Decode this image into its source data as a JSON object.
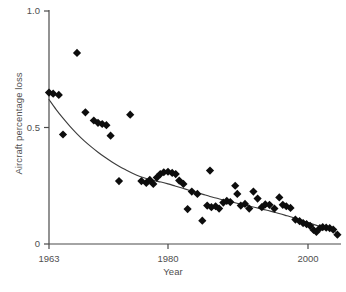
{
  "chart_data": {
    "type": "scatter",
    "title": "",
    "xlabel": "Year",
    "ylabel": "Aircraft percentage loss",
    "xlim": [
      1962,
      2005
    ],
    "ylim": [
      0,
      1.0
    ],
    "xticks": [
      1963,
      1980,
      2000
    ],
    "xticklabels": [
      "1963",
      "1980",
      "2000"
    ],
    "yticks": [
      0,
      0.5,
      1.0
    ],
    "yticklabels": [
      "0",
      "0.5",
      "1.0"
    ],
    "grid": false,
    "legend": null,
    "marker_style": "filled-diamond",
    "marker_color": "#0d0d0d",
    "series": [
      {
        "name": "Aircraft percentage loss",
        "points": [
          [
            1963.0,
            0.65
          ],
          [
            1963.6,
            0.645
          ],
          [
            1964.4,
            0.64
          ],
          [
            1965.0,
            0.47
          ],
          [
            1967.0,
            0.82
          ],
          [
            1968.2,
            0.565
          ],
          [
            1969.4,
            0.53
          ],
          [
            1970.0,
            0.52
          ],
          [
            1970.6,
            0.515
          ],
          [
            1971.2,
            0.51
          ],
          [
            1971.8,
            0.465
          ],
          [
            1973.0,
            0.27
          ],
          [
            1974.6,
            0.555
          ],
          [
            1976.2,
            0.27
          ],
          [
            1976.9,
            0.262
          ],
          [
            1977.4,
            0.275
          ],
          [
            1977.9,
            0.258
          ],
          [
            1978.4,
            0.285
          ],
          [
            1978.9,
            0.3
          ],
          [
            1979.4,
            0.308
          ],
          [
            1980.0,
            0.31
          ],
          [
            1980.6,
            0.305
          ],
          [
            1981.1,
            0.3
          ],
          [
            1981.6,
            0.272
          ],
          [
            1982.2,
            0.258
          ],
          [
            1982.8,
            0.15
          ],
          [
            1983.4,
            0.225
          ],
          [
            1984.2,
            0.215
          ],
          [
            1984.9,
            0.1
          ],
          [
            1985.6,
            0.165
          ],
          [
            1986.2,
            0.158
          ],
          [
            1986.8,
            0.162
          ],
          [
            1987.3,
            0.152
          ],
          [
            1987.9,
            0.178
          ],
          [
            1988.4,
            0.185
          ],
          [
            1986.0,
            0.315
          ],
          [
            1988.9,
            0.18
          ],
          [
            1989.6,
            0.25
          ],
          [
            1989.9,
            0.215
          ],
          [
            1990.4,
            0.165
          ],
          [
            1991.0,
            0.172
          ],
          [
            1991.6,
            0.152
          ],
          [
            1992.2,
            0.225
          ],
          [
            1992.8,
            0.195
          ],
          [
            1993.4,
            0.158
          ],
          [
            1993.9,
            0.17
          ],
          [
            1994.5,
            0.168
          ],
          [
            1995.2,
            0.152
          ],
          [
            1995.9,
            0.2
          ],
          [
            1996.4,
            0.168
          ],
          [
            1996.9,
            0.162
          ],
          [
            1997.5,
            0.155
          ],
          [
            1998.2,
            0.105
          ],
          [
            1998.8,
            0.098
          ],
          [
            1999.3,
            0.09
          ],
          [
            1999.8,
            0.085
          ],
          [
            2000.3,
            0.078
          ],
          [
            2000.8,
            0.06
          ],
          [
            2001.2,
            0.052
          ],
          [
            2001.7,
            0.068
          ],
          [
            2002.1,
            0.072
          ],
          [
            2002.6,
            0.07
          ],
          [
            2003.1,
            0.068
          ],
          [
            2003.6,
            0.062
          ],
          [
            2004.2,
            0.04
          ]
        ]
      }
    ],
    "trend_curve": {
      "name": "fitted exponential decay",
      "points": [
        [
          1963.0,
          0.62
        ],
        [
          1964.0,
          0.578
        ],
        [
          1965.0,
          0.54
        ],
        [
          1966.0,
          0.505
        ],
        [
          1967.0,
          0.473
        ],
        [
          1968.0,
          0.444
        ],
        [
          1969.0,
          0.418
        ],
        [
          1970.0,
          0.394
        ],
        [
          1971.0,
          0.372
        ],
        [
          1972.0,
          0.352
        ],
        [
          1973.0,
          0.334
        ],
        [
          1974.0,
          0.318
        ],
        [
          1975.0,
          0.303
        ],
        [
          1976.0,
          0.29
        ],
        [
          1977.0,
          0.28
        ],
        [
          1978.0,
          0.272
        ],
        [
          1979.0,
          0.266
        ],
        [
          1980.0,
          0.258
        ],
        [
          1981.0,
          0.249
        ],
        [
          1982.0,
          0.24
        ],
        [
          1983.0,
          0.231
        ],
        [
          1984.0,
          0.222
        ],
        [
          1985.0,
          0.213
        ],
        [
          1986.0,
          0.204
        ],
        [
          1987.0,
          0.196
        ],
        [
          1988.0,
          0.188
        ],
        [
          1989.0,
          0.181
        ],
        [
          1990.0,
          0.174
        ],
        [
          1991.0,
          0.167
        ],
        [
          1992.0,
          0.16
        ],
        [
          1993.0,
          0.153
        ],
        [
          1994.0,
          0.146
        ],
        [
          1995.0,
          0.138
        ],
        [
          1996.0,
          0.13
        ],
        [
          1997.0,
          0.121
        ],
        [
          1998.0,
          0.112
        ],
        [
          1999.0,
          0.102
        ],
        [
          2000.0,
          0.092
        ],
        [
          2001.0,
          0.082
        ],
        [
          2002.0,
          0.072
        ],
        [
          2003.0,
          0.062
        ],
        [
          2004.0,
          0.05
        ]
      ]
    }
  },
  "axes": {
    "y_title": "Aircraft percentage loss",
    "x_title": "Year",
    "y_tick_0": "0",
    "y_tick_1": "0.5",
    "y_tick_2": "1.0",
    "x_tick_0": "1963",
    "x_tick_1": "1980",
    "x_tick_2": "2000"
  }
}
